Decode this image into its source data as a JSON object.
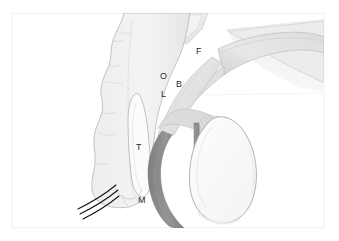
{
  "figure": {
    "type": "anatomical-line-diagram",
    "style": "grayscale shaded schematic with outlined structures",
    "background_color": "#ffffff",
    "frame": {
      "visible": true,
      "border_color": "#f2f2f2",
      "x": 12,
      "y": 13,
      "width": 312,
      "height": 215
    },
    "labels": [
      {
        "id": "label-f",
        "text": "F",
        "x": 196,
        "y": 47
      },
      {
        "id": "label-o",
        "text": "O",
        "x": 160,
        "y": 72
      },
      {
        "id": "label-b",
        "text": "B",
        "x": 176,
        "y": 80
      },
      {
        "id": "label-l",
        "text": "L",
        "x": 161,
        "y": 90
      },
      {
        "id": "label-t",
        "text": "T",
        "x": 136,
        "y": 143
      },
      {
        "id": "label-m",
        "text": "M",
        "x": 138,
        "y": 196
      }
    ],
    "colors": {
      "outline": "#9a9a9a",
      "fill_light": "#f0f0f0",
      "fill_mid": "#e2e2e2",
      "fill_shade": "#d6d6d6",
      "dark_band": "#8a8a8a",
      "dark_line": "#1f1f1f",
      "label_text": "#2b2b2b"
    },
    "structures": [
      {
        "name": "head-capsule",
        "description": "large pale vertical lobed body occupying left-center"
      },
      {
        "name": "upper-plate",
        "description": "pale shaded plate at top center"
      },
      {
        "name": "diagonal-band",
        "description": "shaded diagonal band running from upper right toward center, labelled F"
      },
      {
        "name": "inner-cavity",
        "description": "narrow elongated outlined cavity inside head capsule, labelled T"
      },
      {
        "name": "dark-curved-band",
        "description": "thick dark gray crescent sweeping down and right, labelled M"
      },
      {
        "name": "oval-sac",
        "description": "large outlined leaf shaped sac at lower right"
      },
      {
        "name": "fiber-striations",
        "description": "fine radiating lines above the oval sac"
      },
      {
        "name": "bristles",
        "description": "three thin dark curved bristles at bottom left"
      }
    ]
  }
}
